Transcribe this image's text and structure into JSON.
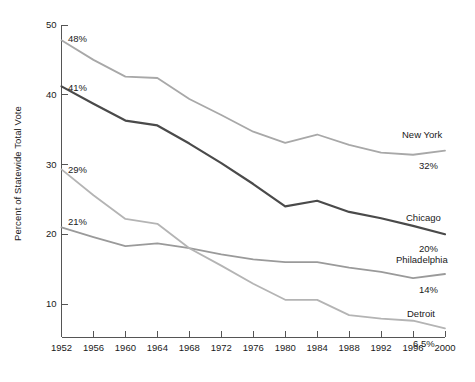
{
  "chart_data": {
    "type": "line",
    "title": "",
    "subtitle": "",
    "xlabel": "",
    "ylabel": "Percent of Statewide Total Vote",
    "xlim": [
      1952,
      2000
    ],
    "ylim": [
      5,
      50
    ],
    "ytick_values": [
      10,
      20,
      30,
      40,
      50
    ],
    "ytick_labels": [
      "10",
      "20",
      "30",
      "40",
      "50"
    ],
    "x": [
      1952,
      1956,
      1960,
      1964,
      1968,
      1972,
      1976,
      1980,
      1984,
      1988,
      1992,
      1996,
      2000
    ],
    "xtick_labels": [
      "1952",
      "1956",
      "1960",
      "1964",
      "1968",
      "1972",
      "1976",
      "1980",
      "1984",
      "1988",
      "1992",
      "1996",
      "2000"
    ],
    "grid": false,
    "legend": "inline-right-of-line-ends",
    "series": [
      {
        "name": "New York",
        "color": "#a8a8a8",
        "start_label": "48%",
        "end_label": "32%",
        "values": [
          47.8,
          45.0,
          42.6,
          42.4,
          39.4,
          37.1,
          34.7,
          33.1,
          34.3,
          32.8,
          31.7,
          31.4,
          32.0
        ]
      },
      {
        "name": "Chicago",
        "color": "#4a4a4a",
        "start_label": "41%",
        "end_label": "20%",
        "values": [
          41.2,
          38.7,
          36.3,
          35.6,
          33.0,
          30.2,
          27.2,
          24.0,
          24.8,
          23.2,
          22.3,
          21.2,
          20.0
        ]
      },
      {
        "name": "Philadelphia",
        "color": "#9a9a9a",
        "start_label": "21%",
        "end_label": "14%",
        "values": [
          21.0,
          19.6,
          18.3,
          18.7,
          18.0,
          17.1,
          16.4,
          16.0,
          16.0,
          15.2,
          14.6,
          13.7,
          14.3
        ]
      },
      {
        "name": "Detroit",
        "color": "#b4b4b4",
        "start_label": "29%",
        "end_label": "6.5%",
        "values": [
          29.3,
          25.6,
          22.2,
          21.5,
          18.0,
          15.5,
          12.9,
          10.6,
          10.6,
          8.4,
          7.9,
          7.6,
          6.5
        ]
      }
    ]
  },
  "labels": {
    "y_axis_title": "Percent of Statewide Total Vote"
  }
}
